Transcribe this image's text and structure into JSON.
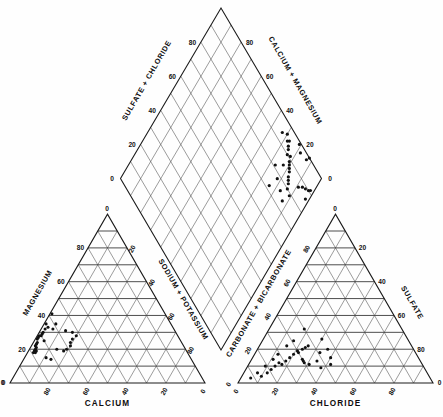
{
  "figure": {
    "type": "piper-trilinear-diagram",
    "background_color": "#ffffff",
    "line_color": "#1a1a1a",
    "point_color": "#111111"
  },
  "cation_triangle": {
    "name": "cation-triangle",
    "left_axis_title": "MAGNESIUM",
    "right_axis_title": "SODIUM + POTASSIUM",
    "bottom_axis_title": "CALCIUM",
    "tick_values": [
      0,
      20,
      40,
      60,
      80
    ],
    "left_ticks": [
      "0",
      "20",
      "40",
      "60",
      "80"
    ],
    "right_ticks": [
      "0",
      "20",
      "40",
      "60",
      "80"
    ],
    "bottom_ticks": [
      "0",
      "20",
      "40",
      "60",
      "80"
    ],
    "apex_tick": "0"
  },
  "anion_triangle": {
    "name": "anion-triangle",
    "left_axis_title": "CARBONATE + BICARBONATE",
    "right_axis_title": "SULFATE",
    "bottom_axis_title": "CHLORIDE",
    "tick_values": [
      0,
      20,
      40,
      60,
      80
    ],
    "left_ticks": [
      "0",
      "20",
      "40",
      "60",
      "80"
    ],
    "right_ticks": [
      "0",
      "20",
      "40",
      "60",
      "80"
    ],
    "bottom_ticks": [
      "0",
      "20",
      "40",
      "60",
      "80"
    ],
    "apex_tick": "0"
  },
  "diamond": {
    "name": "central-diamond",
    "upper_left_axis_title": "SULFATE + CHLORIDE",
    "upper_right_axis_title": "CALCIUM + MAGNESIUM",
    "left_ticks": [
      "0",
      "20",
      "40",
      "60",
      "80"
    ],
    "right_ticks": [
      "0",
      "20",
      "40",
      "60",
      "80"
    ]
  },
  "chart_data": {
    "type": "scatter",
    "title": "",
    "subtitle": "",
    "xlabel": "",
    "ylabel": "",
    "grid": true,
    "legend": "none",
    "axes": {
      "cation_triangle": {
        "components": [
          "CALCIUM",
          "MAGNESIUM",
          "SODIUM + POTASSIUM"
        ],
        "range": [
          0,
          100
        ],
        "ticks": [
          0,
          20,
          40,
          60,
          80
        ]
      },
      "anion_triangle": {
        "components": [
          "CHLORIDE",
          "SULFATE",
          "CARBONATE + BICARBONATE"
        ],
        "range": [
          0,
          100
        ],
        "ticks": [
          0,
          20,
          40,
          60,
          80
        ]
      },
      "diamond": {
        "components": [
          "SULFATE + CHLORIDE",
          "CALCIUM + MAGNESIUM"
        ],
        "range": [
          0,
          100
        ],
        "ticks": [
          0,
          20,
          40,
          60,
          80
        ]
      }
    },
    "cation_points": [
      {
        "ca": 58,
        "mg": 41,
        "na_k": 1
      },
      {
        "ca": 64,
        "mg": 35,
        "na_k": 1
      },
      {
        "ca": 64,
        "mg": 33,
        "na_k": 3
      },
      {
        "ca": 66,
        "mg": 32,
        "na_k": 2
      },
      {
        "ca": 68,
        "mg": 30,
        "na_k": 2
      },
      {
        "ca": 69,
        "mg": 29,
        "na_k": 2
      },
      {
        "ca": 70,
        "mg": 28,
        "na_k": 2
      },
      {
        "ca": 71,
        "mg": 28,
        "na_k": 1
      },
      {
        "ca": 72,
        "mg": 27,
        "na_k": 1
      },
      {
        "ca": 73,
        "mg": 26,
        "na_k": 1
      },
      {
        "ca": 74,
        "mg": 24,
        "na_k": 2
      },
      {
        "ca": 75,
        "mg": 23,
        "na_k": 2
      },
      {
        "ca": 76,
        "mg": 22,
        "na_k": 2
      },
      {
        "ca": 76,
        "mg": 21,
        "na_k": 3
      },
      {
        "ca": 77,
        "mg": 20,
        "na_k": 3
      },
      {
        "ca": 77,
        "mg": 19,
        "na_k": 4
      },
      {
        "ca": 78,
        "mg": 19,
        "na_k": 3
      },
      {
        "ca": 78,
        "mg": 18,
        "na_k": 4
      },
      {
        "ca": 79,
        "mg": 18,
        "na_k": 3
      },
      {
        "ca": 74,
        "mg": 15,
        "na_k": 11
      },
      {
        "ca": 72,
        "mg": 14,
        "na_k": 14
      },
      {
        "ca": 56,
        "mg": 31,
        "na_k": 13
      },
      {
        "ca": 53,
        "mg": 30,
        "na_k": 17
      },
      {
        "ca": 52,
        "mg": 28,
        "na_k": 20
      },
      {
        "ca": 55,
        "mg": 26,
        "na_k": 19
      },
      {
        "ca": 57,
        "mg": 24,
        "na_k": 19
      },
      {
        "ca": 58,
        "mg": 22,
        "na_k": 20
      },
      {
        "ca": 61,
        "mg": 20,
        "na_k": 19
      },
      {
        "ca": 63,
        "mg": 19,
        "na_k": 18
      },
      {
        "ca": 66,
        "mg": 20,
        "na_k": 14
      },
      {
        "ca": 70,
        "mg": 25,
        "na_k": 5
      },
      {
        "ca": 62,
        "mg": 32,
        "na_k": 6
      },
      {
        "ca": 59,
        "mg": 35,
        "na_k": 6
      }
    ],
    "anion_points": [
      {
        "cl": 5,
        "so4": 3,
        "hco3": 92
      },
      {
        "cl": 10,
        "so4": 4,
        "hco3": 86
      },
      {
        "cl": 12,
        "so4": 6,
        "hco3": 82
      },
      {
        "cl": 13,
        "so4": 8,
        "hco3": 79
      },
      {
        "cl": 14,
        "so4": 10,
        "hco3": 76
      },
      {
        "cl": 15,
        "so4": 12,
        "hco3": 73
      },
      {
        "cl": 17,
        "so4": 11,
        "hco3": 72
      },
      {
        "cl": 18,
        "so4": 13,
        "hco3": 69
      },
      {
        "cl": 19,
        "so4": 15,
        "hco3": 66
      },
      {
        "cl": 20,
        "so4": 17,
        "hco3": 63
      },
      {
        "cl": 21,
        "so4": 19,
        "hco3": 60
      },
      {
        "cl": 22,
        "so4": 18,
        "hco3": 60
      },
      {
        "cl": 23,
        "so4": 20,
        "hco3": 57
      },
      {
        "cl": 24,
        "so4": 21,
        "hco3": 55
      },
      {
        "cl": 25,
        "so4": 22,
        "hco3": 53
      },
      {
        "cl": 26,
        "so4": 14,
        "hco3": 60
      },
      {
        "cl": 27,
        "so4": 13,
        "hco3": 60
      },
      {
        "cl": 28,
        "so4": 12,
        "hco3": 60
      },
      {
        "cl": 30,
        "so4": 26,
        "hco3": 44
      },
      {
        "cl": 31,
        "so4": 11,
        "hco3": 58
      },
      {
        "cl": 33,
        "so4": 18,
        "hco3": 49
      },
      {
        "cl": 34,
        "so4": 13,
        "hco3": 53
      },
      {
        "cl": 36,
        "so4": 20,
        "hco3": 44
      },
      {
        "cl": 38,
        "so4": 9,
        "hco3": 53
      },
      {
        "cl": 40,
        "so4": 15,
        "hco3": 45
      },
      {
        "cl": 42,
        "so4": 11,
        "hco3": 47
      },
      {
        "cl": 18,
        "so4": 32,
        "hco3": 50
      },
      {
        "cl": 16,
        "so4": 25,
        "hco3": 59
      },
      {
        "cl": 14,
        "so4": 22,
        "hco3": 64
      },
      {
        "cl": 12,
        "so4": 17,
        "hco3": 71
      },
      {
        "cl": 11,
        "so4": 14,
        "hco3": 75
      },
      {
        "cl": 9,
        "so4": 10,
        "hco3": 81
      },
      {
        "cl": 7,
        "so4": 6,
        "hco3": 87
      }
    ],
    "diamond_points": [
      {
        "ca_mg": 96,
        "so4_cl": 30
      },
      {
        "ca_mg": 95,
        "so4_cl": 27
      },
      {
        "ca_mg": 94,
        "so4_cl": 28
      },
      {
        "ca_mg": 93,
        "so4_cl": 26
      },
      {
        "ca_mg": 92,
        "so4_cl": 25
      },
      {
        "ca_mg": 90,
        "so4_cl": 24
      },
      {
        "ca_mg": 91,
        "so4_cl": 22
      },
      {
        "ca_mg": 89,
        "so4_cl": 21
      },
      {
        "ca_mg": 88,
        "so4_cl": 20
      },
      {
        "ca_mg": 87,
        "so4_cl": 19
      },
      {
        "ca_mg": 86,
        "so4_cl": 18
      },
      {
        "ca_mg": 85,
        "so4_cl": 23
      },
      {
        "ca_mg": 84,
        "so4_cl": 17
      },
      {
        "ca_mg": 83,
        "so4_cl": 16
      },
      {
        "ca_mg": 82,
        "so4_cl": 15
      },
      {
        "ca_mg": 80,
        "so4_cl": 14
      },
      {
        "ca_mg": 97,
        "so4_cl": 18
      },
      {
        "ca_mg": 98,
        "so4_cl": 13
      },
      {
        "ca_mg": 78,
        "so4_cl": 22
      },
      {
        "ca_mg": 76,
        "so4_cl": 17
      },
      {
        "ca_mg": 74,
        "so4_cl": 13
      },
      {
        "ca_mg": 72,
        "so4_cl": 24
      },
      {
        "ca_mg": 86,
        "so4_cl": 9
      },
      {
        "ca_mg": 88,
        "so4_cl": 7
      },
      {
        "ca_mg": 89,
        "so4_cl": 5
      },
      {
        "ca_mg": 90,
        "so4_cl": 3
      },
      {
        "ca_mg": 91,
        "so4_cl": 2
      },
      {
        "ca_mg": 86,
        "so4_cl": 2
      },
      {
        "ca_mg": 100,
        "so4_cl": 12
      },
      {
        "ca_mg": 99,
        "so4_cl": 21
      },
      {
        "ca_mg": 94,
        "so4_cl": 33
      },
      {
        "ca_mg": 81,
        "so4_cl": 27
      },
      {
        "ca_mg": 79,
        "so4_cl": 11
      }
    ]
  }
}
